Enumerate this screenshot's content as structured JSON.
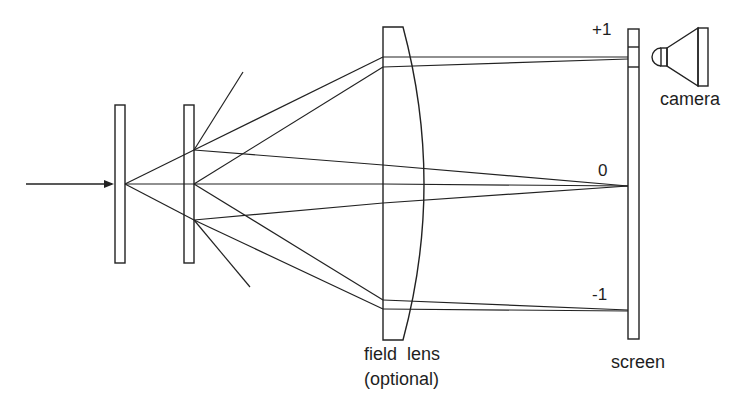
{
  "diagram": {
    "type": "optical-setup",
    "elements": [
      {
        "id": "input-beam",
        "kind": "arrow"
      },
      {
        "id": "grating-1",
        "kind": "plate"
      },
      {
        "id": "grating-2",
        "kind": "plate"
      },
      {
        "id": "field-lens",
        "kind": "plano-convex-lens"
      },
      {
        "id": "screen",
        "kind": "screen"
      },
      {
        "id": "camera",
        "kind": "camera"
      }
    ],
    "labels": {
      "order_plus1": "+1",
      "order_zero": "0",
      "order_minus1": "-1",
      "camera": "camera",
      "field_lens_line1": "field  lens",
      "field_lens_line2": "(optional)",
      "screen": "screen"
    },
    "colors": {
      "line": "#222222",
      "background": "#ffffff"
    }
  }
}
